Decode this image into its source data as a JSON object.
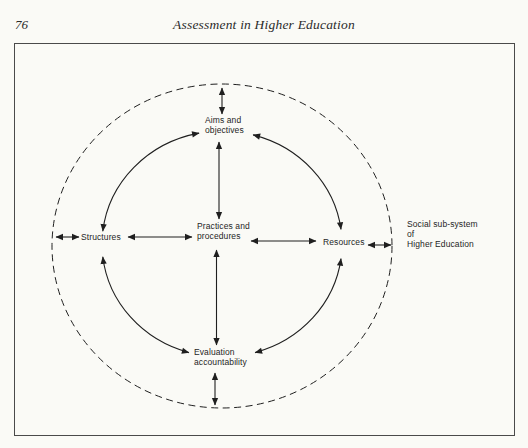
{
  "page": {
    "number": "76",
    "running_title": "Assessment in Higher Education"
  },
  "figure": {
    "nodes": {
      "aims": {
        "line1": "Aims and",
        "line2": "objectives"
      },
      "structures": {
        "label": "Structures"
      },
      "practices": {
        "line1": "Practices and",
        "line2": "procedures"
      },
      "resources": {
        "label": "Resources"
      },
      "evaluation": {
        "line1": "Evaluation",
        "line2": "accountability"
      },
      "environment": {
        "line1": "Social sub-system",
        "line2": "of",
        "line3": "Higher Education"
      }
    },
    "edges": [
      {
        "from": "aims",
        "to": "resources",
        "style": "curved",
        "bidirectional": true
      },
      {
        "from": "resources",
        "to": "evaluation",
        "style": "curved",
        "bidirectional": true
      },
      {
        "from": "evaluation",
        "to": "structures",
        "style": "curved",
        "bidirectional": true
      },
      {
        "from": "structures",
        "to": "aims",
        "style": "curved",
        "bidirectional": true
      },
      {
        "from": "practices",
        "to": "aims",
        "style": "straight",
        "bidirectional": true
      },
      {
        "from": "practices",
        "to": "evaluation",
        "style": "straight",
        "bidirectional": true
      },
      {
        "from": "practices",
        "to": "structures",
        "style": "straight",
        "bidirectional": true
      },
      {
        "from": "practices",
        "to": "resources",
        "style": "straight",
        "bidirectional": true
      },
      {
        "from": "aims",
        "to": "boundary",
        "style": "straight",
        "bidirectional": true
      },
      {
        "from": "evaluation",
        "to": "boundary",
        "style": "straight",
        "bidirectional": true
      },
      {
        "from": "structures",
        "to": "boundary",
        "style": "straight",
        "bidirectional": true
      },
      {
        "from": "resources",
        "to": "boundary",
        "style": "straight",
        "bidirectional": true
      }
    ],
    "colors": {
      "ink": "#1f1f1f",
      "paper": "#fafaf6",
      "frame": "#4a4a4a"
    }
  }
}
